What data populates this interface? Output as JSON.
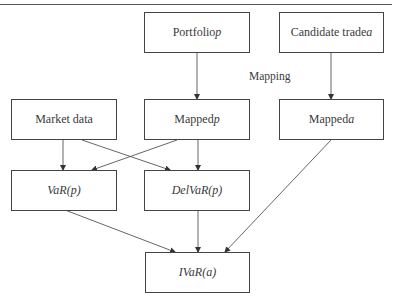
{
  "diagram": {
    "nodes": {
      "portfolio": {
        "text": "Portfolio ",
        "var": "p"
      },
      "candidate": {
        "text": "Candidate trade ",
        "var": "a"
      },
      "market_data": {
        "text": "Market data"
      },
      "mapped_p": {
        "text": "Mapped ",
        "var": "p"
      },
      "mapped_a": {
        "text": "Mapped ",
        "var": "a"
      },
      "var_p": {
        "text": "VaR(p)"
      },
      "delvar_p": {
        "text": "DelVaR(p)"
      },
      "ivar_a": {
        "text": "IVaR(a)"
      }
    },
    "labels": {
      "mapping": "Mapping"
    },
    "edges": [
      {
        "from": "Portfolio p",
        "to": "Mapped p"
      },
      {
        "from": "Candidate trade a",
        "to": "Mapped a"
      },
      {
        "from": "Market data",
        "to": "VaR(p)"
      },
      {
        "from": "Market data",
        "to": "DelVaR(p)"
      },
      {
        "from": "Mapped p",
        "to": "VaR(p)"
      },
      {
        "from": "Mapped p",
        "to": "DelVaR(p)"
      },
      {
        "from": "VaR(p)",
        "to": "IVaR(a)"
      },
      {
        "from": "DelVaR(p)",
        "to": "IVaR(a)"
      },
      {
        "from": "Mapped a",
        "to": "IVaR(a)"
      }
    ],
    "colors": {
      "line": "#444444",
      "text": "#3a3a3a"
    }
  }
}
